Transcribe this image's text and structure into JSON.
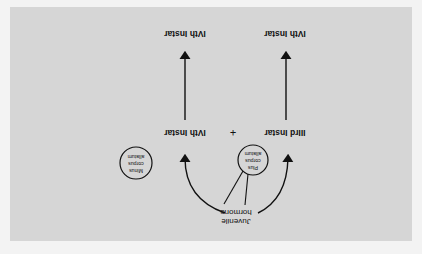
{
  "diagram": {
    "orientation": "rotated 180 degrees",
    "panel_color": "#d6d6d6",
    "page_color": "#f3f3f3",
    "ink_color": "#111111",
    "left_column": {
      "start_label": "IIIrd Instar",
      "end_label": "IVth Instar"
    },
    "right_column": {
      "start_label": "IVth Instar",
      "end_label": "IVth Instar"
    },
    "plus_sign": "+",
    "hormone_label_line1": "Juvenile",
    "hormone_label_line2": "hormone",
    "plus_circle": {
      "line1": "Plus",
      "line2": "corpus",
      "line3": "allatum"
    },
    "minus_circle": {
      "line1": "Minus",
      "line2": "corpus",
      "line3": "allatum"
    }
  }
}
